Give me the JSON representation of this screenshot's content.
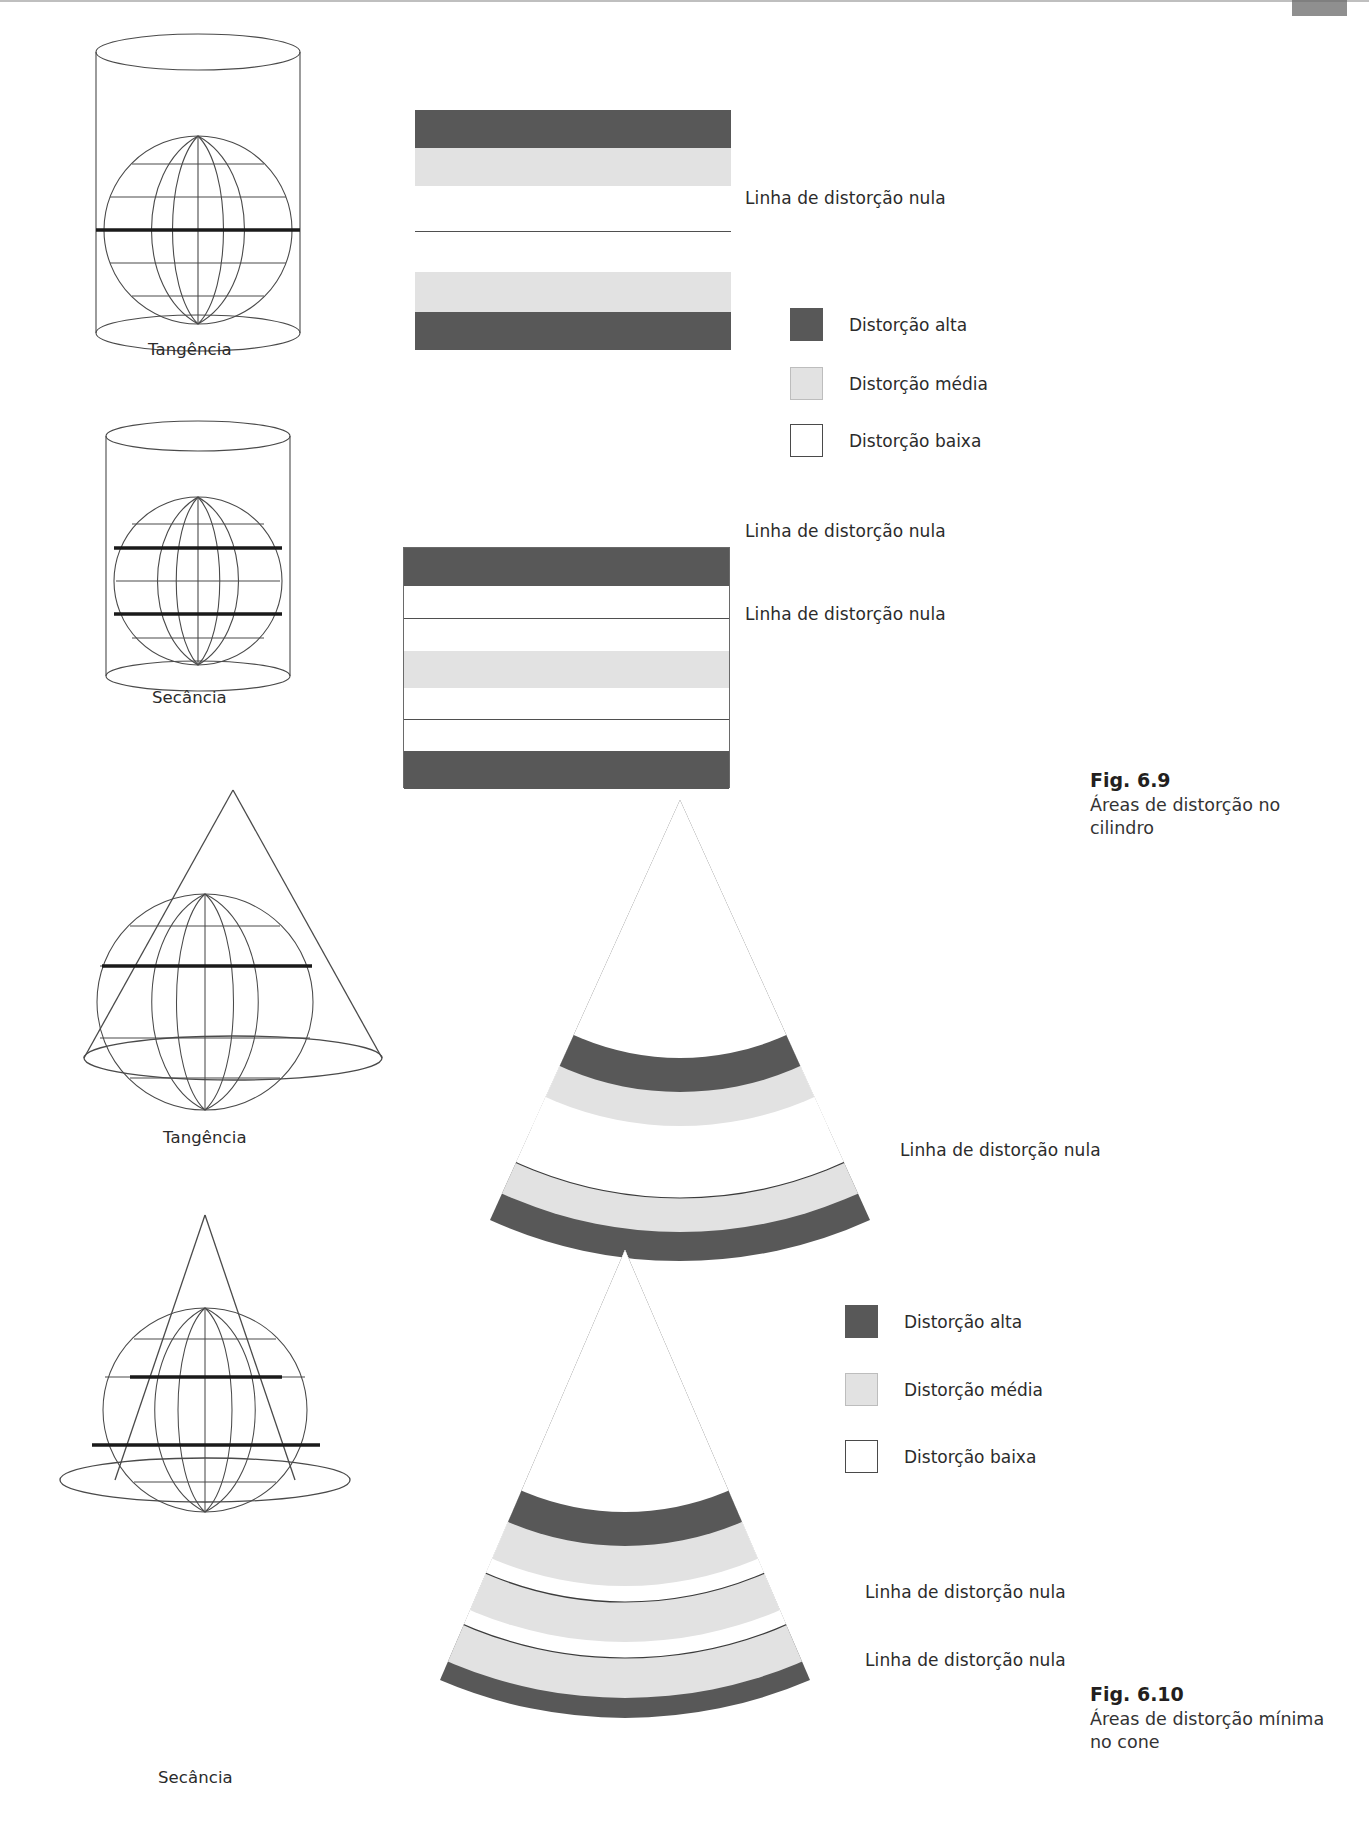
{
  "page": {
    "width": 1369,
    "height": 1831,
    "background": "#ffffff"
  },
  "colors": {
    "high": "#585858",
    "medium": "#e2e2e2",
    "low": "#ffffff",
    "line": "#4f4f4f",
    "stroke": "#4a4a4a",
    "text": "#2b2b2b"
  },
  "figures": [
    {
      "id": "fig-6-9",
      "caption_title": "Fig. 6.9",
      "caption_body": "Áreas de distorção no cilindro",
      "diagrams": [
        {
          "id": "cylinder-tangent",
          "shape_label": "Tangência",
          "annotations": [
            "Linha de distorção nula"
          ],
          "bands": [
            {
              "zone": "alta",
              "color": "#585858"
            },
            {
              "zone": "média",
              "color": "#e2e2e2"
            },
            {
              "zone": "baixa",
              "color": "#ffffff"
            },
            {
              "zone": "baixa",
              "color": "#ffffff"
            },
            {
              "zone": "média",
              "color": "#e2e2e2"
            },
            {
              "zone": "alta",
              "color": "#585858"
            }
          ]
        },
        {
          "id": "cylinder-secant",
          "shape_label": "Secância",
          "annotations": [
            "Linha de distorção nula",
            "Linha de distorção nula"
          ],
          "bands": [
            {
              "zone": "alta",
              "color": "#585858"
            },
            {
              "zone": "baixa",
              "color": "#ffffff"
            },
            {
              "zone": "baixa",
              "color": "#ffffff"
            },
            {
              "zone": "média",
              "color": "#e2e2e2"
            },
            {
              "zone": "baixa",
              "color": "#ffffff"
            },
            {
              "zone": "baixa",
              "color": "#ffffff"
            },
            {
              "zone": "alta",
              "color": "#585858"
            }
          ]
        }
      ],
      "legend": [
        {
          "label": "Distorção alta",
          "swatch": "high"
        },
        {
          "label": "Distorção média",
          "swatch": "medium"
        },
        {
          "label": "Distorção baixa",
          "swatch": "low"
        }
      ]
    },
    {
      "id": "fig-6-10",
      "caption_title": "Fig. 6.10",
      "caption_body": "Áreas de distorção mínima no cone",
      "diagrams": [
        {
          "id": "cone-tangent",
          "shape_label": "Tangência",
          "annotations": [
            "Linha de distorção nula"
          ],
          "bands": [
            {
              "zone": "alta",
              "color": "#585858"
            },
            {
              "zone": "média",
              "color": "#e2e2e2"
            },
            {
              "zone": "baixa",
              "color": "#ffffff"
            },
            {
              "zone": "baixa",
              "color": "#ffffff"
            },
            {
              "zone": "média",
              "color": "#e2e2e2"
            },
            {
              "zone": "alta",
              "color": "#585858"
            }
          ]
        },
        {
          "id": "cone-secant",
          "shape_label": "Secância",
          "annotations": [
            "Linha de distorção nula",
            "Linha de distorção nula"
          ],
          "bands": [
            {
              "zone": "alta",
              "color": "#585858"
            },
            {
              "zone": "média",
              "color": "#e2e2e2"
            },
            {
              "zone": "baixa",
              "color": "#ffffff"
            },
            {
              "zone": "média",
              "color": "#e2e2e2"
            },
            {
              "zone": "baixa",
              "color": "#ffffff"
            },
            {
              "zone": "alta",
              "color": "#585858"
            }
          ]
        }
      ],
      "legend": [
        {
          "label": "Distorção alta",
          "swatch": "high"
        },
        {
          "label": "Distorção média",
          "swatch": "medium"
        },
        {
          "label": "Distorção baixa",
          "swatch": "low"
        }
      ]
    }
  ]
}
